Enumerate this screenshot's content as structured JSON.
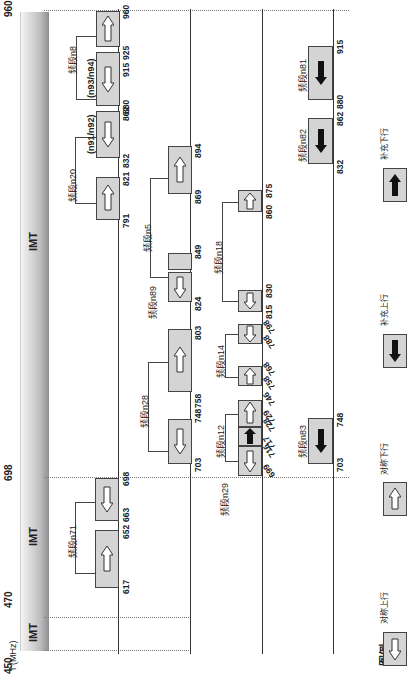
{
  "axis": {
    "unit_label": "f (MHz)",
    "itu_label": "ITU:",
    "ticks": [
      "450",
      "470",
      "698",
      "960"
    ],
    "segments": [
      {
        "label": "IMT",
        "from": 450,
        "to": 470
      },
      {
        "label": "IMT",
        "from": 470,
        "to": 698
      },
      {
        "label": "IMT",
        "from": 698,
        "to": 960
      }
    ]
  },
  "bands": {
    "n71": {
      "label": "频段n71",
      "ul": [
        663,
        698
      ],
      "dl": [
        617,
        652
      ],
      "nums": [
        "617",
        "652",
        "663",
        "698"
      ]
    },
    "n8": {
      "label": "频段n8",
      "ul": [
        880,
        915
      ],
      "dl": [
        925,
        960
      ],
      "nums": [
        "880",
        "915",
        "925",
        "960"
      ]
    },
    "n20": {
      "label": "频段n20",
      "ul": [
        832,
        862
      ],
      "dl": [
        791,
        821
      ],
      "nums": [
        "791",
        "821",
        "832",
        "862"
      ]
    },
    "n91n92": {
      "label": "(n91/n92)"
    },
    "n93n94": {
      "label": "(n93/n94)"
    },
    "n28": {
      "label": "频段n28",
      "ul": [
        703,
        748
      ],
      "dl": [
        758,
        803
      ],
      "nums": [
        "703",
        "748",
        "758",
        "803"
      ]
    },
    "n5": {
      "label": "频段n5",
      "ul": [
        824,
        849
      ],
      "dl": [
        869,
        894
      ],
      "nums": [
        "824",
        "849",
        "869",
        "894"
      ]
    },
    "n89": {
      "label": "频段n89"
    },
    "n12": {
      "label": "频段n12",
      "ul": [
        699,
        716
      ],
      "dl": [
        729,
        746
      ],
      "nums": [
        "699",
        "716",
        "717",
        "728",
        "729",
        "746"
      ]
    },
    "n29": {
      "label": "频段n29",
      "sdl": [
        717,
        728
      ]
    },
    "n14": {
      "label": "频段n14",
      "ul": [
        788,
        798
      ],
      "dl": [
        758,
        768
      ],
      "nums": [
        "758",
        "768",
        "788",
        "798"
      ]
    },
    "n18": {
      "label": "频段n18",
      "ul": [
        815,
        830
      ],
      "dl": [
        860,
        875
      ],
      "nums": [
        "815",
        "830",
        "860",
        "875"
      ]
    },
    "n83": {
      "label": "频段n83",
      "sul": [
        703,
        748
      ],
      "nums": [
        "703",
        "748"
      ]
    },
    "n82": {
      "label": "频段n82",
      "sul": [
        832,
        862
      ],
      "nums": [
        "832",
        "862"
      ]
    },
    "n81": {
      "label": "频段n81",
      "sul": [
        880,
        915
      ],
      "nums": [
        "880",
        "915"
      ]
    }
  },
  "legend": {
    "title": "图例:",
    "items": [
      {
        "label": "对称上行",
        "icon": "hollow-arrow-left"
      },
      {
        "label": "对称下行",
        "icon": "hollow-arrow-right"
      },
      {
        "label": "补充上行",
        "icon": "solid-arrow-left"
      },
      {
        "label": "补充下行",
        "icon": "solid-arrow-right"
      }
    ]
  },
  "colors": {
    "block_fill": "#d4d4d4",
    "border": "#444444",
    "bar_dark": "#8e8e8e",
    "bar_light": "#f4f4f4"
  }
}
